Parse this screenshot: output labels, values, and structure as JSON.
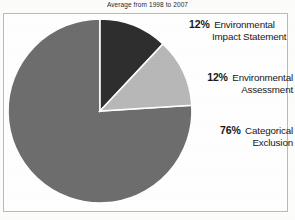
{
  "chart_data": {
    "type": "pie",
    "title": "Average from 1998 to 2007",
    "xlabel": "",
    "ylabel": "",
    "legend_position": "right-callouts",
    "grid": false,
    "categories": [
      "Environmental Impact Statement",
      "Environmental Assessment",
      "Categorical Exclusion"
    ],
    "values": [
      12,
      76,
      12
    ],
    "labels": [
      "12%",
      "12%",
      "76%"
    ],
    "slices": [
      {
        "name": "Environmental Impact Statement",
        "percent": 12,
        "percent_label": "12%",
        "label_line1": "Environmental",
        "label_line2": "Impact Statement",
        "color": "#2e2e2e",
        "start_angle": 0,
        "end_angle": 43.2
      },
      {
        "name": "Environmental Assessment",
        "percent": 12,
        "percent_label": "12%",
        "label_line1": "Environmental",
        "label_line2": "Assessment",
        "color": "#b8b8b8",
        "start_angle": 43.2,
        "end_angle": 86.4
      },
      {
        "name": "Categorical Exclusion",
        "percent": 76,
        "percent_label": "76%",
        "label_line1": "Categorical",
        "label_line2": "Exclusion",
        "color": "#6e6e6e",
        "start_angle": 86.4,
        "end_angle": 360
      }
    ]
  },
  "colors": {
    "slice_dark": "#2e2e2e",
    "slice_light": "#b8b8b8",
    "slice_mid": "#6e6e6e",
    "frame": "#c9c9c9",
    "text": "#17171a",
    "background": "#ffffff"
  }
}
